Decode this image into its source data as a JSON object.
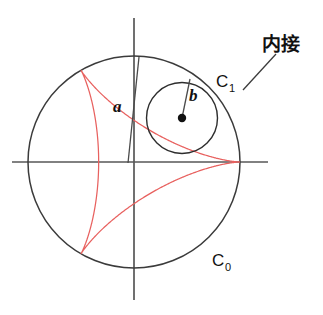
{
  "figure": {
    "kind": "geometry-diagram",
    "title": "",
    "background_color": "#ffffff",
    "canvas": {
      "width": 323,
      "height": 315
    }
  },
  "colors": {
    "curve": "#e8615f",
    "outer_circle": "#3b3b3b",
    "inner_circle": "#2e2e2e",
    "axis": "#575757",
    "text": "#111111",
    "dot": "#111111"
  },
  "labels": {
    "outer_circle_base": "C",
    "outer_circle_sub": "0",
    "inner_circle_base": "C",
    "inner_circle_sub": "1",
    "outer_radius": "a",
    "inner_radius": "b",
    "annotation": "内接"
  },
  "geometry": {
    "outer_circle": {
      "cx": 134,
      "cy": 162,
      "r": 106
    },
    "inner_circle": {
      "cx": 182,
      "cy": 118,
      "r": 35.5
    },
    "inner_circle_center_dot_r": 4.2,
    "axes": {
      "x_axis": {
        "x1": 12,
        "y1": 162,
        "x2": 268,
        "y2": 162
      },
      "y_axis": {
        "x1": 134,
        "y1": 18,
        "x2": 134,
        "y2": 300
      }
    },
    "deltoid": {
      "cusp_angles_deg": [
        0,
        120,
        240
      ],
      "cusps": [
        {
          "x": 240,
          "y": 162
        },
        {
          "x": 81,
          "y": 70
        },
        {
          "x": 81,
          "y": 254
        }
      ],
      "R": 106,
      "r": 35.333
    },
    "radius_marker_a": {
      "x1": 128,
      "y1": 163,
      "x2": 139,
      "y2": 57
    },
    "radius_marker_b": {
      "x1": 182,
      "y1": 118,
      "x2": 190,
      "y2": 79
    },
    "annotation_pointer": {
      "x1": 243,
      "y1": 90,
      "x2": 276,
      "y2": 54
    }
  },
  "label_positions": {
    "a": {
      "x": 113,
      "y": 112
    },
    "b": {
      "x": 189,
      "y": 101
    },
    "C1": {
      "x": 216,
      "y": 87
    },
    "C1_sub": {
      "x": 229,
      "y": 92
    },
    "C0": {
      "x": 212,
      "y": 266
    },
    "C0_sub": {
      "x": 225,
      "y": 271
    },
    "annotation": {
      "x": 262,
      "y": 51
    }
  }
}
